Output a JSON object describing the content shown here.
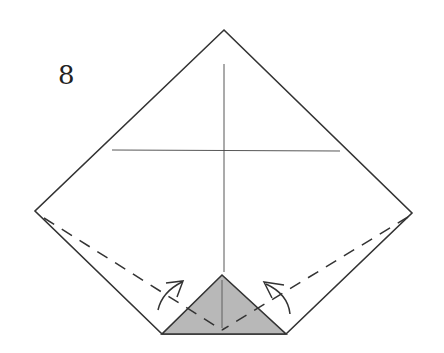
{
  "diagram": {
    "type": "origami-instruction",
    "step_number": "8",
    "colors": {
      "outline": "#333333",
      "crease": "#444444",
      "shaded_flap": "#b8b8b8",
      "background": "#ffffff"
    },
    "elements": {
      "paper_outline": "pentagon (square with bottom corner folded up)",
      "crease_lines": [
        "vertical center crease",
        "horizontal crease"
      ],
      "shaded_flap": "folded bottom triangle",
      "valley_folds": [
        "left edge to center dashed line",
        "right edge to center dashed line"
      ],
      "arrows": [
        "left fold arrow",
        "right fold arrow"
      ]
    }
  }
}
